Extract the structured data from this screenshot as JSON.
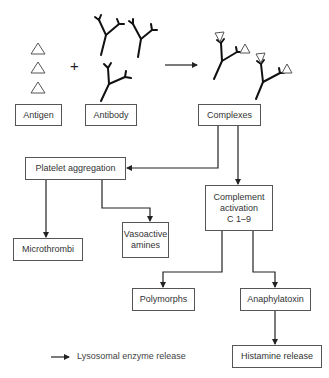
{
  "diagram": {
    "inputs": {
      "antigen": {
        "label": "Antigen"
      },
      "plus": "+",
      "antibody": {
        "label": "Antibody"
      }
    },
    "complexes": {
      "label": "Complexes"
    },
    "platelet_aggregation": {
      "label": "Platelet aggregation"
    },
    "complement_activation": {
      "line1": "Complement",
      "line2": "activation",
      "line3": "C 1–9"
    },
    "microthrombi": {
      "label": "Microthrombi"
    },
    "vasoactive_amines": {
      "line1": "Vasoactive",
      "line2": "amines"
    },
    "polymorphs": {
      "label": "Polymorphs"
    },
    "anaphylatoxin": {
      "label": "Anaphylatoxin"
    },
    "histamine_release": {
      "label": "Histamine release"
    },
    "legend": {
      "arrow_label": "Lysosomal enzyme release"
    },
    "edges": [
      {
        "from": "antigen+antibody",
        "to": "complexes"
      },
      {
        "from": "complexes",
        "to": "platelet_aggregation"
      },
      {
        "from": "complexes",
        "to": "complement_activation"
      },
      {
        "from": "platelet_aggregation",
        "to": "microthrombi"
      },
      {
        "from": "platelet_aggregation",
        "to": "vasoactive_amines"
      },
      {
        "from": "complement_activation",
        "to": "polymorphs"
      },
      {
        "from": "complement_activation",
        "to": "anaphylatoxin"
      },
      {
        "from": "anaphylatoxin",
        "to": "histamine_release"
      }
    ]
  }
}
